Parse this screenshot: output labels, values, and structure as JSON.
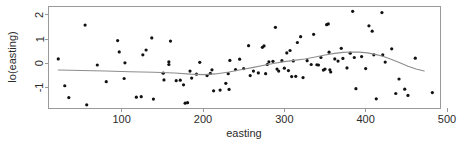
{
  "chart_data": {
    "type": "scatter",
    "title": "",
    "xlabel": "easting",
    "ylabel": "lo(easting)",
    "xlim": [
      10,
      492
    ],
    "ylim": [
      -1.85,
      2.35
    ],
    "xticks": [
      100,
      200,
      300,
      400,
      500
    ],
    "xticklabels": [
      "100",
      "200",
      "300",
      "400",
      "500"
    ],
    "yticks": [
      -1,
      0,
      1,
      2
    ],
    "yticklabels": [
      "-1",
      "0",
      "1",
      "2"
    ],
    "grid": false,
    "legend": null,
    "point_color": "#111111",
    "curve_color": "#8d8d8d",
    "frame_color": "#9a9a9a",
    "points": [
      [
        22,
        0.18
      ],
      [
        30,
        -0.93
      ],
      [
        35,
        -1.42
      ],
      [
        55,
        1.58
      ],
      [
        57,
        -1.72
      ],
      [
        70,
        -0.07
      ],
      [
        81,
        -0.76
      ],
      [
        95,
        0.94
      ],
      [
        97,
        0.47
      ],
      [
        103,
        -0.63
      ],
      [
        104,
        0.02
      ],
      [
        118,
        -1.4
      ],
      [
        124,
        -1.38
      ],
      [
        126,
        0.35
      ],
      [
        130,
        0.55
      ],
      [
        137,
        1.05
      ],
      [
        139,
        -1.48
      ],
      [
        151,
        -0.41
      ],
      [
        152,
        -0.69
      ],
      [
        158,
        0.06
      ],
      [
        158,
        -0.05
      ],
      [
        160,
        0.92
      ],
      [
        167,
        -0.72
      ],
      [
        172,
        -0.7
      ],
      [
        176,
        -0.89
      ],
      [
        178,
        -1.65
      ],
      [
        181,
        -1.63
      ],
      [
        184,
        -0.32
      ],
      [
        186,
        -0.61
      ],
      [
        192,
        -0.45
      ],
      [
        196,
        0.04
      ],
      [
        205,
        -0.51
      ],
      [
        209,
        -0.42
      ],
      [
        211,
        -0.27
      ],
      [
        213,
        -1.14
      ],
      [
        221,
        -1.11
      ],
      [
        228,
        -0.83
      ],
      [
        231,
        -0.43
      ],
      [
        232,
        -1.08
      ],
      [
        233,
        0.12
      ],
      [
        240,
        -0.26
      ],
      [
        245,
        0.17
      ],
      [
        250,
        -0.22
      ],
      [
        256,
        0.73
      ],
      [
        258,
        -0.51
      ],
      [
        262,
        -0.32
      ],
      [
        268,
        -0.4
      ],
      [
        273,
        0.66
      ],
      [
        275,
        0.72
      ],
      [
        277,
        -0.43
      ],
      [
        279,
        -0.05
      ],
      [
        281,
        0.06
      ],
      [
        286,
        0.08
      ],
      [
        289,
        1.49
      ],
      [
        291,
        -0.24
      ],
      [
        293,
        -0.32
      ],
      [
        297,
        0.11
      ],
      [
        300,
        -0.2
      ],
      [
        303,
        0.43
      ],
      [
        305,
        -0.3
      ],
      [
        307,
        0.53
      ],
      [
        309,
        -0.55
      ],
      [
        311,
        0.1
      ],
      [
        314,
        -0.54
      ],
      [
        316,
        0.86
      ],
      [
        320,
        1.1
      ],
      [
        323,
        -0.59
      ],
      [
        328,
        0.11
      ],
      [
        333,
        -0.05
      ],
      [
        336,
        1.2
      ],
      [
        340,
        -0.06
      ],
      [
        342,
        -0.07
      ],
      [
        345,
        0.24
      ],
      [
        348,
        -0.28
      ],
      [
        350,
        -0.24
      ],
      [
        352,
        1.6
      ],
      [
        354,
        1.63
      ],
      [
        355,
        0.46
      ],
      [
        356,
        -0.27
      ],
      [
        357,
        -0.36
      ],
      [
        362,
        0.18
      ],
      [
        366,
        0.09
      ],
      [
        370,
        0.62
      ],
      [
        372,
        0.2
      ],
      [
        377,
        -0.19
      ],
      [
        381,
        0.42
      ],
      [
        384,
        2.15
      ],
      [
        386,
        0.24
      ],
      [
        388,
        -1.05
      ],
      [
        395,
        0.28
      ],
      [
        400,
        -0.22
      ],
      [
        404,
        1.55
      ],
      [
        408,
        1.33
      ],
      [
        410,
        0.35
      ],
      [
        413,
        -1.47
      ],
      [
        420,
        2.1
      ],
      [
        421,
        0.35
      ],
      [
        424,
        0.05
      ],
      [
        432,
        0.6
      ],
      [
        437,
        -1.25
      ],
      [
        441,
        -0.65
      ],
      [
        448,
        -1.07
      ],
      [
        452,
        -1.33
      ],
      [
        461,
        0.21
      ],
      [
        482,
        -1.21
      ]
    ],
    "curve": [
      [
        22,
        -0.28
      ],
      [
        50,
        -0.3
      ],
      [
        80,
        -0.32
      ],
      [
        110,
        -0.35
      ],
      [
        140,
        -0.37
      ],
      [
        165,
        -0.4
      ],
      [
        185,
        -0.45
      ],
      [
        200,
        -0.47
      ],
      [
        215,
        -0.44
      ],
      [
        232,
        -0.36
      ],
      [
        248,
        -0.26
      ],
      [
        262,
        -0.17
      ],
      [
        275,
        -0.08
      ],
      [
        288,
        0.0
      ],
      [
        300,
        0.07
      ],
      [
        312,
        0.12
      ],
      [
        325,
        0.18
      ],
      [
        338,
        0.26
      ],
      [
        350,
        0.34
      ],
      [
        362,
        0.41
      ],
      [
        372,
        0.45
      ],
      [
        382,
        0.47
      ],
      [
        392,
        0.46
      ],
      [
        402,
        0.43
      ],
      [
        412,
        0.37
      ],
      [
        422,
        0.28
      ],
      [
        432,
        0.16
      ],
      [
        442,
        0.02
      ],
      [
        452,
        -0.12
      ],
      [
        462,
        -0.24
      ],
      [
        472,
        -0.32
      ]
    ]
  }
}
